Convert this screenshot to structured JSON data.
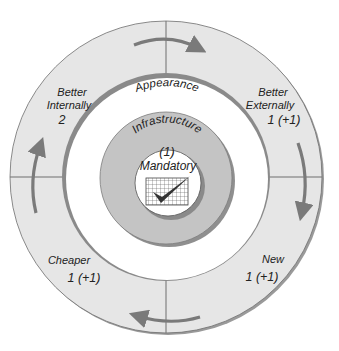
{
  "diagram": {
    "center_label": "Mandatory",
    "center_icon": "checked-grid-icon",
    "inner_ring": {
      "label": "Infrastructure",
      "count": "(1)"
    },
    "middle_ring": {
      "label": "Appearance"
    },
    "quadrants": [
      {
        "id": "better-internally",
        "title_line1": "Better",
        "title_line2": "Internally",
        "count": "2"
      },
      {
        "id": "better-externally",
        "title_line1": "Better",
        "title_line2": "Externally",
        "count": "1 (+1)"
      },
      {
        "id": "new",
        "title_line1": "New",
        "count": "1 (+1)"
      },
      {
        "id": "cheaper",
        "title_line1": "Cheaper",
        "count": "1 (+1)"
      }
    ],
    "flow_direction": "clockwise",
    "colors": {
      "outer_ring_fill": "#e6e6e6",
      "ring_edge": "#8a8a8a",
      "infrastructure_fill": "#c4c4c4",
      "arrow": "#7a7a7a",
      "text": "#222222"
    }
  }
}
